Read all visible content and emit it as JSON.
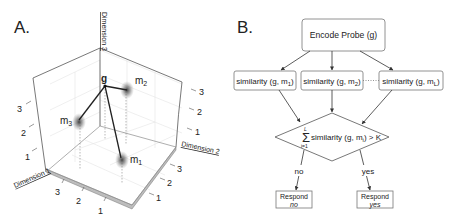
{
  "panel_a": {
    "label": "A.",
    "axes": {
      "dimension_1": "Dimension 1",
      "dimension_2": "Dimension 2",
      "dimension_3": "Dimension 3"
    },
    "ticks": {
      "dim1": [
        "1",
        "2",
        "3"
      ],
      "dim2": [
        "1",
        "2",
        "3"
      ],
      "dim3_left": [
        "1",
        "2",
        "3"
      ],
      "dim3_right": [
        "1",
        "2",
        "3"
      ]
    },
    "points": {
      "probe": "g",
      "m1": {
        "base": "m",
        "sub": "1"
      },
      "m2": {
        "base": "m",
        "sub": "2"
      },
      "m3": {
        "base": "m",
        "sub": "3"
      }
    }
  },
  "panel_b": {
    "label": "B.",
    "encode": "Encode Probe (g)",
    "similarity_prefix": "similarity (g, m",
    "similarity_suffix": ")",
    "sim_subs": [
      "1",
      "2",
      "L"
    ],
    "decision": {
      "sum_top": "L",
      "sum_bottom": "i=1",
      "text_prefix": "similarity (g, m",
      "sub": "i",
      "text_suffix": ") > K"
    },
    "branch_no": "no",
    "branch_yes": "yes",
    "respond_no": {
      "line1": "Respond",
      "line2": "no"
    },
    "respond_yes": {
      "line1": "Respond",
      "line2": "yes"
    }
  }
}
